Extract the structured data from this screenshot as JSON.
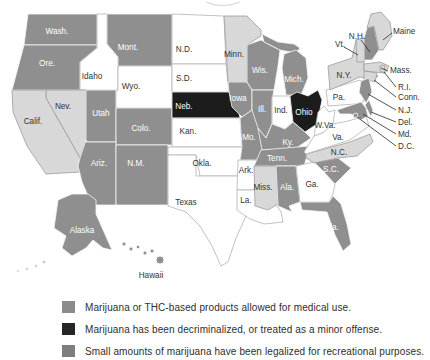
{
  "figure": {
    "name": "U.S. state marijuana laws map"
  },
  "colors": {
    "medical": "#8f8f8f",
    "decriminalized": "#1c1c1c",
    "recreational": "#d8d8d8",
    "none": "#ffffff",
    "border_on_fill": "#f6f6f6",
    "border_on_light": "#9c9c9c",
    "border_on_white": "#b3b3b3",
    "label_dark": "#333333",
    "label_light": "#ffffff",
    "leader": "#2a2a2a"
  },
  "legend": {
    "items": [
      {
        "swatch_color": "#8b8b8b",
        "label": "Marijuana or THC-based products allowed for medical use."
      },
      {
        "swatch_color": "#262626",
        "label": "Marijuana has been decriminalized, or treated as a minor offense."
      },
      {
        "swatch_color": "#7e7e7e",
        "label": "Small amounts of marijuana have been legalized for recreational purposes."
      }
    ]
  },
  "map": {
    "states": [
      {
        "id": "WA",
        "label": "Wash.",
        "category": "medical",
        "label_color": "light"
      },
      {
        "id": "OR",
        "label": "Ore.",
        "category": "medical",
        "label_color": "light"
      },
      {
        "id": "CA",
        "label": "Calif.",
        "category": "recreational",
        "label_color": "dark"
      },
      {
        "id": "NV",
        "label": "Nev.",
        "category": "recreational",
        "label_color": "dark"
      },
      {
        "id": "ID",
        "label": "Idaho",
        "category": "none",
        "label_color": "dark"
      },
      {
        "id": "MT",
        "label": "Mont.",
        "category": "medical",
        "label_color": "light"
      },
      {
        "id": "WY",
        "label": "Wyo.",
        "category": "none",
        "label_color": "dark"
      },
      {
        "id": "UT",
        "label": "Utah",
        "category": "medical",
        "label_color": "light"
      },
      {
        "id": "CO",
        "label": "Colo.",
        "category": "medical",
        "label_color": "light"
      },
      {
        "id": "AZ",
        "label": "Ariz.",
        "category": "medical",
        "label_color": "light"
      },
      {
        "id": "NM",
        "label": "N.M.",
        "category": "medical",
        "label_color": "light"
      },
      {
        "id": "ND",
        "label": "N.D.",
        "category": "none",
        "label_color": "dark"
      },
      {
        "id": "SD",
        "label": "S.D.",
        "category": "none",
        "label_color": "dark"
      },
      {
        "id": "NE",
        "label": "Neb.",
        "category": "decriminalized",
        "label_color": "light"
      },
      {
        "id": "KS",
        "label": "Kan.",
        "category": "none",
        "label_color": "dark"
      },
      {
        "id": "OK",
        "label": "Okla.",
        "category": "none",
        "label_color": "dark"
      },
      {
        "id": "TX",
        "label": "Texas",
        "category": "none",
        "label_color": "dark"
      },
      {
        "id": "MN",
        "label": "Minn.",
        "category": "recreational",
        "label_color": "dark"
      },
      {
        "id": "IA",
        "label": "Iowa",
        "category": "medical",
        "label_color": "light"
      },
      {
        "id": "MO",
        "label": "Mo.",
        "category": "medical",
        "label_color": "light"
      },
      {
        "id": "AR",
        "label": "Ark.",
        "category": "none",
        "label_color": "dark"
      },
      {
        "id": "LA",
        "label": "La.",
        "category": "none",
        "label_color": "dark"
      },
      {
        "id": "WI",
        "label": "Wis.",
        "category": "medical",
        "label_color": "light"
      },
      {
        "id": "IL",
        "label": "Ill.",
        "category": "medical",
        "label_color": "light"
      },
      {
        "id": "MI",
        "label": "Mich.",
        "category": "medical",
        "label_color": "light"
      },
      {
        "id": "IN",
        "label": "Ind.",
        "category": "none",
        "label_color": "dark"
      },
      {
        "id": "OH",
        "label": "Ohio",
        "category": "decriminalized",
        "label_color": "light"
      },
      {
        "id": "KY",
        "label": "Ky.",
        "category": "medical",
        "label_color": "light"
      },
      {
        "id": "TN",
        "label": "Tenn.",
        "category": "medical",
        "label_color": "light"
      },
      {
        "id": "MS",
        "label": "Miss.",
        "category": "recreational",
        "label_color": "dark"
      },
      {
        "id": "AL",
        "label": "Ala.",
        "category": "medical",
        "label_color": "light"
      },
      {
        "id": "GA",
        "label": "Ga.",
        "category": "none",
        "label_color": "dark"
      },
      {
        "id": "FL",
        "label": "Fla.",
        "category": "medical",
        "label_color": "light"
      },
      {
        "id": "SC",
        "label": "S.C.",
        "category": "medical",
        "label_color": "light"
      },
      {
        "id": "NC",
        "label": "N.C.",
        "category": "recreational",
        "label_color": "dark"
      },
      {
        "id": "VA",
        "label": "Va.",
        "category": "none",
        "label_color": "dark"
      },
      {
        "id": "WV",
        "label": "W.Va.",
        "category": "none",
        "label_color": "dark"
      },
      {
        "id": "PA",
        "label": "Pa.",
        "category": "none",
        "label_color": "dark"
      },
      {
        "id": "NY",
        "label": "N.Y.",
        "category": "recreational",
        "label_color": "dark"
      },
      {
        "id": "VT",
        "label": "Vt.",
        "category": "recreational",
        "label_color": "dark"
      },
      {
        "id": "NH",
        "label": "N.H.",
        "category": "medical",
        "label_color": "dark"
      },
      {
        "id": "ME",
        "label": "Maine",
        "category": "recreational",
        "label_color": "dark"
      },
      {
        "id": "MA",
        "label": "Mass.",
        "category": "recreational",
        "label_color": "dark"
      },
      {
        "id": "RI",
        "label": "R.I.",
        "category": "recreational",
        "label_color": "dark"
      },
      {
        "id": "CT",
        "label": "Conn.",
        "category": "recreational",
        "label_color": "dark"
      },
      {
        "id": "NJ",
        "label": "N.J.",
        "category": "medical",
        "label_color": "dark"
      },
      {
        "id": "DE",
        "label": "Del.",
        "category": "medical",
        "label_color": "dark"
      },
      {
        "id": "MD",
        "label": "Md.",
        "category": "medical",
        "label_color": "dark"
      },
      {
        "id": "DC",
        "label": "D.C.",
        "category": "medical",
        "label_color": "dark"
      },
      {
        "id": "AK",
        "label": "Alaska",
        "category": "medical",
        "label_color": "light"
      },
      {
        "id": "HI",
        "label": "Hawaii",
        "category": "medical",
        "label_color": "dark"
      }
    ]
  }
}
